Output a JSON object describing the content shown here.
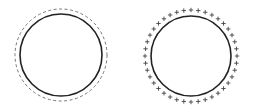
{
  "diagram": {
    "colors": {
      "background": "#ffffff",
      "solid_stroke": "#222222",
      "dashed_stroke": "#666666",
      "plus_color": "#444444"
    },
    "left_figure": {
      "center": [
        61,
        55
      ],
      "solid_radius": 41,
      "dashed_radius": 46,
      "solid_stroke_width": 1.6,
      "dashed_stroke_width": 0.9,
      "dash_pattern": "3,2.5"
    },
    "right_figure": {
      "center": [
        191,
        56
      ],
      "solid_radius": 40,
      "marker_radius": 46,
      "marker_count": 40,
      "marker_glyph": "+",
      "solid_stroke_width": 1.6
    }
  }
}
